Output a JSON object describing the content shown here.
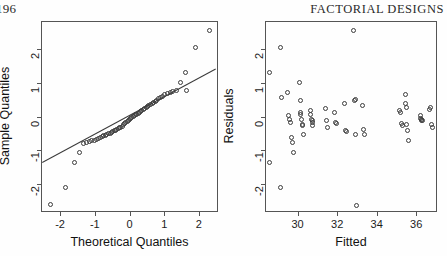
{
  "page": {
    "folio": "196",
    "running_head": "FACTORIAL DESIGNS",
    "width": 447,
    "height": 256,
    "background_color": "#fefefe",
    "ink_color": "#3c3c3c"
  },
  "chart_data": [
    {
      "id": "normal-qq-plot",
      "type": "scatter",
      "title": "",
      "xlabel": "Theoretical Quantiles",
      "ylabel": "Sample Quantiles",
      "xlim": [
        -2.55,
        2.55
      ],
      "ylim": [
        -2.85,
        2.85
      ],
      "xticks": [
        -2,
        -1,
        0,
        1,
        2
      ],
      "xticklabels": [
        "-2",
        "-1",
        "0",
        "1",
        "2"
      ],
      "yticks": [
        -2,
        -1,
        0,
        1,
        2
      ],
      "yticklabels": [
        "-2",
        "-1",
        "0",
        "1",
        "2"
      ],
      "grid": false,
      "legend": null,
      "marker": "open-circle",
      "annotations": [
        {
          "kind": "reference-line",
          "label": "qq-line",
          "x1": -2.55,
          "y1": -1.33,
          "x2": 2.45,
          "y2": 1.46
        }
      ],
      "x": [
        -2.3,
        -1.88,
        -1.62,
        -1.47,
        -1.34,
        -1.26,
        -1.18,
        -1.11,
        -1.04,
        -0.98,
        -0.92,
        -0.87,
        -0.82,
        -0.77,
        -0.72,
        -0.68,
        -0.63,
        -0.59,
        -0.55,
        -0.51,
        -0.47,
        -0.43,
        -0.39,
        -0.35,
        -0.31,
        -0.28,
        -0.24,
        -0.2,
        -0.17,
        -0.13,
        -0.1,
        -0.06,
        -0.03,
        0.01,
        0.04,
        0.08,
        0.11,
        0.15,
        0.18,
        0.22,
        0.26,
        0.29,
        0.33,
        0.37,
        0.41,
        0.45,
        0.49,
        0.53,
        0.57,
        0.62,
        0.66,
        0.71,
        0.76,
        0.81,
        0.87,
        0.93,
        0.99,
        1.06,
        1.14,
        1.22,
        1.32,
        1.43,
        1.58,
        1.62,
        1.86,
        2.28
      ],
      "y": [
        -2.6,
        -2.1,
        -1.34,
        -1.05,
        -0.79,
        -0.76,
        -0.72,
        -0.7,
        -0.68,
        -0.65,
        -0.62,
        -0.6,
        -0.58,
        -0.55,
        -0.53,
        -0.51,
        -0.49,
        -0.47,
        -0.45,
        -0.42,
        -0.4,
        -0.38,
        -0.35,
        -0.33,
        -0.31,
        -0.29,
        -0.26,
        -0.22,
        -0.19,
        -0.16,
        -0.13,
        -0.1,
        -0.07,
        -0.04,
        -0.01,
        0.02,
        0.05,
        0.08,
        0.1,
        0.13,
        0.15,
        0.18,
        0.21,
        0.24,
        0.27,
        0.3,
        0.33,
        0.36,
        0.39,
        0.42,
        0.45,
        0.48,
        0.52,
        0.56,
        0.6,
        0.64,
        0.68,
        0.72,
        0.75,
        0.77,
        0.8,
        1.05,
        1.35,
        0.82,
        2.08,
        2.6
      ]
    },
    {
      "id": "residuals-vs-fitted-plot",
      "type": "scatter",
      "title": "",
      "xlabel": "Fitted",
      "ylabel": "Residuals",
      "xlim": [
        28.35,
        37.05
      ],
      "ylim": [
        -2.85,
        2.85
      ],
      "xticks": [
        30,
        32,
        34,
        36
      ],
      "xticklabels": [
        "30",
        "32",
        "34",
        "36"
      ],
      "yticks": [
        -2,
        -1,
        0,
        1,
        2
      ],
      "yticklabels": [
        "-2",
        "-1",
        "0",
        "1",
        "2"
      ],
      "grid": false,
      "legend": null,
      "marker": "open-circle",
      "annotations": [],
      "x": [
        28.55,
        28.55,
        29.1,
        29.1,
        29.15,
        29.45,
        29.5,
        29.55,
        29.6,
        29.65,
        29.7,
        29.72,
        30.05,
        30.08,
        30.1,
        30.12,
        30.15,
        30.18,
        30.2,
        30.25,
        30.6,
        30.62,
        30.65,
        30.68,
        30.7,
        30.72,
        31.35,
        31.4,
        31.45,
        31.8,
        31.85,
        31.9,
        32.3,
        32.35,
        32.4,
        32.8,
        32.85,
        32.88,
        32.9,
        32.92,
        33.25,
        33.3,
        33.35,
        35.1,
        35.15,
        35.2,
        35.25,
        35.4,
        35.42,
        35.45,
        35.48,
        35.5,
        35.55,
        36.15,
        36.18,
        36.2,
        36.22,
        36.25,
        36.6,
        36.65,
        36.7,
        36.75
      ],
      "y": [
        1.35,
        -1.34,
        2.08,
        -2.1,
        0.6,
        0.76,
        0.05,
        -0.05,
        -0.15,
        -0.6,
        -0.75,
        -1.05,
        1.05,
        0.5,
        0.15,
        0.1,
        -0.05,
        -0.2,
        -0.25,
        -0.5,
        0.2,
        0.1,
        -0.05,
        -0.1,
        -0.15,
        -0.25,
        0.28,
        -0.1,
        -0.3,
        0.15,
        -0.15,
        -0.18,
        0.42,
        -0.4,
        -0.42,
        2.6,
        0.52,
        0.55,
        -0.5,
        -2.62,
        0.35,
        -0.35,
        -0.52,
        0.2,
        0.15,
        -0.18,
        -0.25,
        0.7,
        0.42,
        0.3,
        -0.2,
        -0.4,
        -0.68,
        0.05,
        -0.02,
        -0.05,
        -0.08,
        -0.1,
        0.25,
        0.3,
        -0.22,
        -0.3
      ]
    }
  ]
}
